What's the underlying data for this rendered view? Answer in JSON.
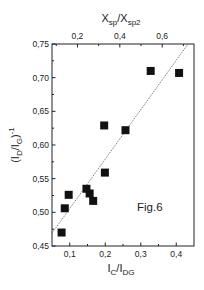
{
  "chart_data": {
    "type": "scatter",
    "title": "",
    "annotation": "Fig.6",
    "xlabel": "I_C/I_DG",
    "xlabel_parts": {
      "main1": "I",
      "sub1": "C",
      "mid": "/I",
      "sub2": "DG"
    },
    "x2label": "X_sp/X_sp2",
    "x2label_parts": {
      "main1": "X",
      "sub1": "sp",
      "mid": "/X",
      "sub2": "sp2"
    },
    "ylabel": "(I_D/I_G)^-1",
    "ylabel_parts": {
      "open": "(I",
      "sub1": "D",
      "mid": "/I",
      "sub2": "G",
      "close": ")",
      "sup": "-1"
    },
    "xlim": [
      0.05,
      0.45
    ],
    "ylim": [
      0.45,
      0.75
    ],
    "x2lim": [
      0.08,
      0.75
    ],
    "xticks": [
      0.1,
      0.2,
      0.3,
      0.4
    ],
    "xtick_labels": [
      "0,1",
      "0,2",
      "0,3",
      "0,4"
    ],
    "x2ticks": [
      0.2,
      0.4,
      0.6
    ],
    "x2tick_labels": [
      "0,2",
      "0,4",
      "0,6"
    ],
    "yticks": [
      0.45,
      0.5,
      0.55,
      0.6,
      0.65,
      0.7,
      0.75
    ],
    "ytick_labels": [
      "0,45",
      "0,50",
      "0,55",
      "0,60",
      "0,65",
      "0,70",
      "0,75"
    ],
    "grid": false,
    "legend": null,
    "series": [
      {
        "name": "data",
        "marker": "filled-square",
        "color": "#111111",
        "x": [
          0.077,
          0.086,
          0.097,
          0.147,
          0.156,
          0.166,
          0.199,
          0.197,
          0.257,
          0.328,
          0.408
        ],
        "y": [
          0.47,
          0.506,
          0.526,
          0.535,
          0.528,
          0.517,
          0.559,
          0.629,
          0.622,
          0.71,
          0.707
        ]
      },
      {
        "name": "linear fit",
        "type": "line",
        "style": "dotted",
        "color": "#555555",
        "x": [
          0.05,
          0.433
        ],
        "y": [
          0.469,
          0.75
        ]
      }
    ]
  }
}
